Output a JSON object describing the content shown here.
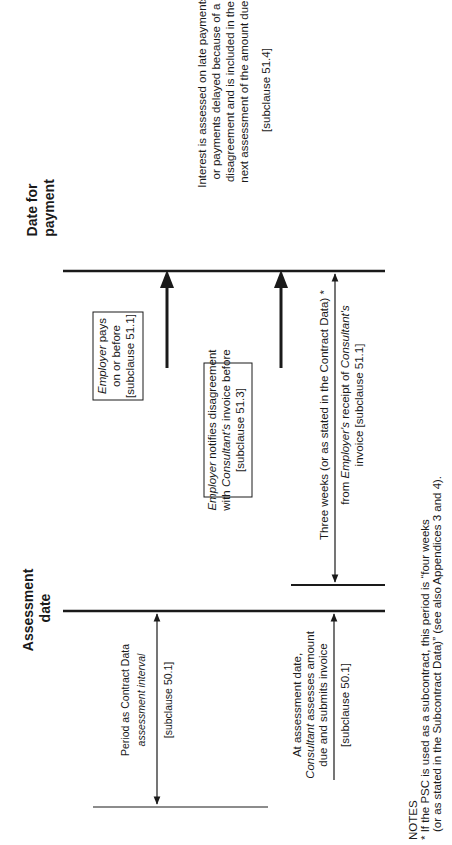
{
  "milestones": {
    "date_for_payment": {
      "line1": "Date for",
      "line2": "payment"
    },
    "assessment_date": {
      "line1": "Assessment",
      "line2": "date"
    }
  },
  "interest_note": {
    "lines": [
      "Interest is assessed on late payments",
      "or payments delayed because of a",
      "disagreement and is included in the",
      "next assessment of the amount due."
    ],
    "clause": "[subclause 51.4]"
  },
  "employer_pays_box": {
    "line1_italic": "Employer",
    "line1_rest": " pays",
    "line2": "on or before",
    "line3": "[subclause 51.1]"
  },
  "disagreement_box": {
    "line1_italic": "Employer",
    "line1_rest": " notifies disagreement",
    "line2_pre": "with ",
    "line2_italic": "Consultant's",
    "line2_rest": " invoice before",
    "line3": "[subclause 51.3]"
  },
  "three_weeks": {
    "line1": "Three weeks (or as stated in the Contract Data) *",
    "line2_pre": "from ",
    "line2_italic": "Employer's",
    "line2_mid": " receipt of ",
    "line2_italic2": "Consultant's",
    "line3": "invoice [subclause 51.1]"
  },
  "assessment_interval": {
    "line1": "Period as Contract Data",
    "line2_italic": "assessment interval",
    "clause": "[subclause 50.1]"
  },
  "consultant_assesses": {
    "line1": "At assessment date,",
    "line2_italic": "Consultant",
    "line2_rest": " assesses amount",
    "line3": "due and submits invoice",
    "clause": "[subclause 50.1]"
  },
  "notes": {
    "heading": "NOTES",
    "line1": "* If the PSC is used as a subcontract, this period is “four weeks",
    "line2": "(or as stated in the Subcontract Data)” (see also Appendices 3 and 4)."
  },
  "colors": {
    "ink": "#1a1a1a",
    "background": "#ffffff"
  }
}
